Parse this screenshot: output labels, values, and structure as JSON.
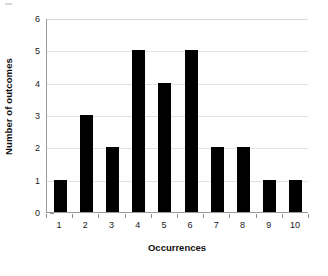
{
  "chart_data": {
    "type": "bar",
    "title": "",
    "xlabel": "Occurrences",
    "ylabel": "Number of outcomes",
    "categories": [
      "1",
      "2",
      "3",
      "4",
      "5",
      "6",
      "7",
      "8",
      "9",
      "10"
    ],
    "values": [
      1,
      3,
      2,
      5,
      4,
      5,
      2,
      2,
      1,
      1
    ],
    "ylim": [
      0,
      6
    ],
    "ytick_labels": [
      "0",
      "1",
      "2",
      "3",
      "4",
      "5",
      "6"
    ],
    "ytick_values": [
      0,
      1,
      2,
      3,
      4,
      5,
      6
    ],
    "grid": true,
    "grid_axis": "y",
    "legend": false,
    "bar_color": "#000000",
    "grid_color": "#e3e3e3",
    "axis_color": "#9a9a9a",
    "background_color": "#ffffff"
  }
}
